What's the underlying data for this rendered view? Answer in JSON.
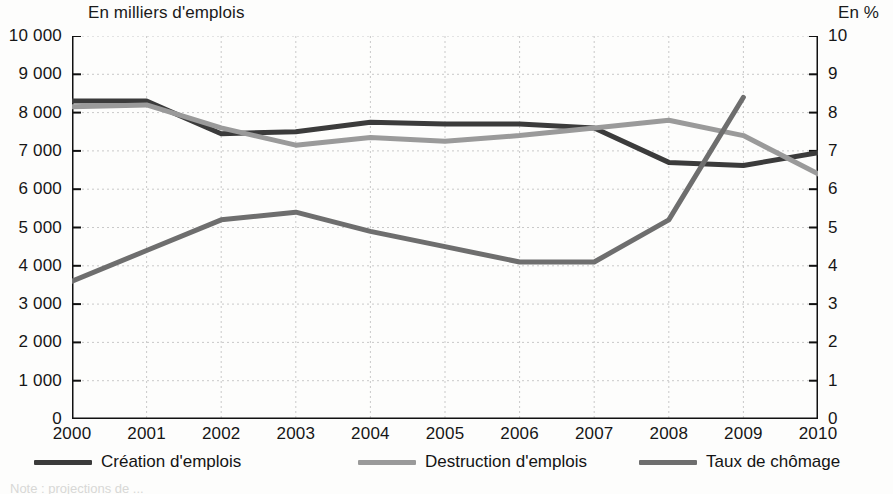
{
  "captions": {
    "left": "En milliers d'emplois",
    "right": "En %"
  },
  "footnote": "Note : projections de ...",
  "legend": [
    {
      "label": "Création d'emplois",
      "color": "#3b3b3b"
    },
    {
      "label": "Destruction d'emplois",
      "color": "#9a9a9a"
    },
    {
      "label": "Taux de chômage",
      "color": "#6e6e6e"
    }
  ],
  "chart_data": {
    "type": "line",
    "title": "",
    "xlabel": "",
    "ylabel": "En milliers d'emplois",
    "y2label": "En %",
    "grid": true,
    "legend_position": "bottom",
    "categories": [
      "2000",
      "2001",
      "2002",
      "2003",
      "2004",
      "2005",
      "2006",
      "2007",
      "2008",
      "2009",
      "2010"
    ],
    "x": [
      2000,
      2001,
      2002,
      2003,
      2004,
      2005,
      2006,
      2007,
      2008,
      2009,
      2010
    ],
    "ylim": [
      0,
      10000
    ],
    "yticks": [
      "0",
      "1 000",
      "2 000",
      "3 000",
      "4 000",
      "5 000",
      "6 000",
      "7 000",
      "8 000",
      "9 000",
      "10 000"
    ],
    "ytick_values": [
      0,
      1000,
      2000,
      3000,
      4000,
      5000,
      6000,
      7000,
      8000,
      9000,
      10000
    ],
    "y2lim": [
      0,
      10
    ],
    "y2ticks": [
      "0",
      "1",
      "2",
      "3",
      "4",
      "5",
      "6",
      "7",
      "8",
      "9",
      "10"
    ],
    "y2tick_values": [
      0,
      1,
      2,
      3,
      4,
      5,
      6,
      7,
      8,
      9,
      10
    ],
    "series": [
      {
        "name": "Création d'emplois",
        "axis": "left",
        "color": "#3b3b3b",
        "width": 5,
        "values": [
          8300,
          8300,
          7450,
          7500,
          7750,
          7700,
          7700,
          7600,
          6700,
          6620,
          6950
        ]
      },
      {
        "name": "Destruction d'emplois",
        "axis": "left",
        "color": "#9a9a9a",
        "width": 5,
        "values": [
          8150,
          8200,
          7600,
          7150,
          7350,
          7250,
          7400,
          7600,
          7800,
          7400,
          6400
        ]
      },
      {
        "name": "Taux de chômage",
        "axis": "right",
        "color": "#6e6e6e",
        "width": 5,
        "values": [
          3.6,
          4.4,
          5.2,
          5.4,
          4.9,
          4.5,
          4.1,
          4.1,
          5.2,
          8.4,
          null
        ]
      }
    ]
  }
}
